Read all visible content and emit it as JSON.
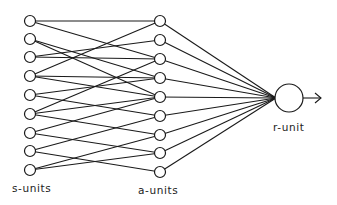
{
  "diagram": {
    "labels": {
      "s_units": "s-units",
      "a_units": "a-units",
      "r_unit": "r-unit"
    },
    "colors": {
      "stroke": "#1a1a1a",
      "fill": "#ffffff",
      "background": "#ffffff"
    },
    "s_units": {
      "x": 30,
      "r": 5.5,
      "y": [
        21,
        39,
        57,
        76,
        95,
        114,
        133,
        151,
        170
      ]
    },
    "a_units": {
      "x": 160,
      "r": 5.5,
      "y": [
        21,
        40,
        59,
        78,
        97,
        116,
        135,
        153,
        172
      ]
    },
    "r_unit": {
      "x": 289,
      "y": 98,
      "r": 14
    },
    "output_arrow": {
      "x1": 303,
      "x2": 321,
      "y": 98
    },
    "s_to_a_connections": [
      [
        0,
        0
      ],
      [
        0,
        2
      ],
      [
        1,
        3
      ],
      [
        1,
        4
      ],
      [
        2,
        1
      ],
      [
        2,
        2
      ],
      [
        3,
        0
      ],
      [
        3,
        3
      ],
      [
        3,
        4
      ],
      [
        4,
        3
      ],
      [
        4,
        5
      ],
      [
        5,
        2
      ],
      [
        5,
        4
      ],
      [
        5,
        6
      ],
      [
        6,
        4
      ],
      [
        6,
        7
      ],
      [
        7,
        5
      ],
      [
        7,
        8
      ],
      [
        8,
        6
      ],
      [
        8,
        7
      ]
    ],
    "a_to_r": "all"
  }
}
